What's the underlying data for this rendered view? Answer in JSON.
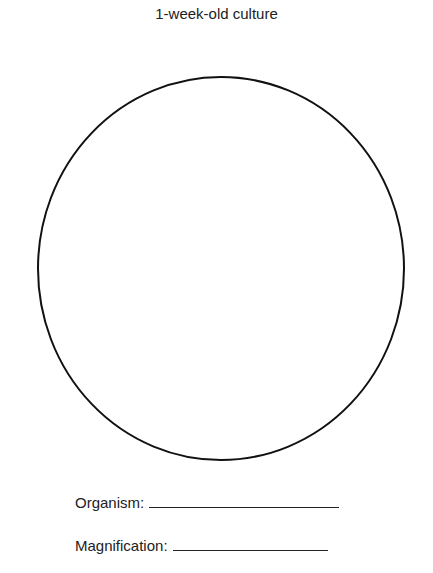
{
  "title": "1-week-old culture",
  "figure": {
    "shape": "circle",
    "stroke_color": "#111111",
    "fill_color": "#ffffff"
  },
  "fields": [
    {
      "label": "Organism:",
      "value": ""
    },
    {
      "label": "Magnification:",
      "value": ""
    }
  ]
}
